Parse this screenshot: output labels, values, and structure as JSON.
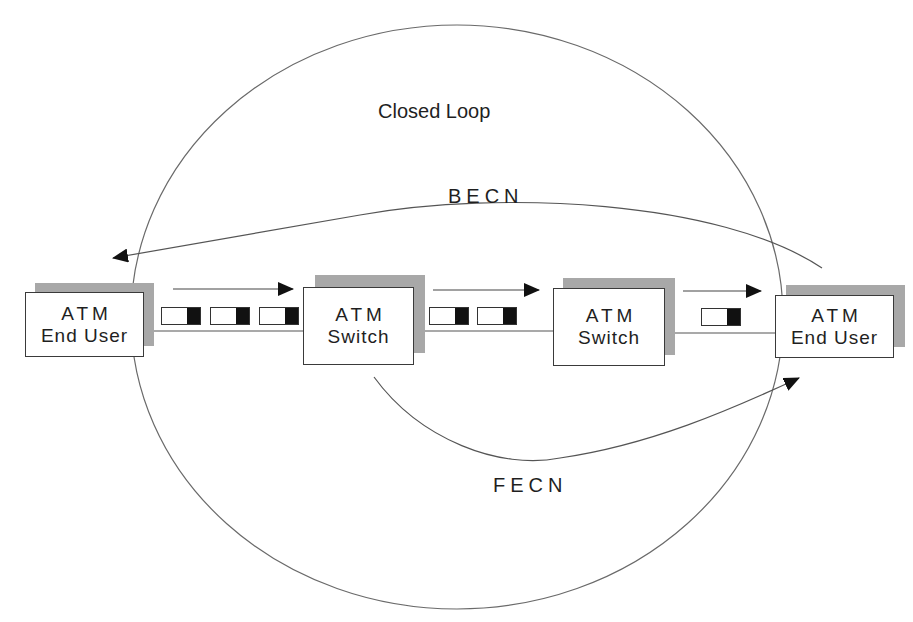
{
  "diagram": {
    "title": "Closed Loop",
    "colors": {
      "line": "#555555",
      "box_border": "#3a3a3a",
      "shadow": "#a8a8a8",
      "cell_header": "#111111",
      "background": "#ffffff"
    },
    "nodes": [
      {
        "id": "end-user-left",
        "line1": "ATM",
        "line2": "End User"
      },
      {
        "id": "switch-1",
        "line1": "ATM",
        "line2": "Switch"
      },
      {
        "id": "switch-2",
        "line1": "ATM",
        "line2": "Switch"
      },
      {
        "id": "end-user-right",
        "line1": "ATM",
        "line2": "End User"
      }
    ],
    "links": [
      {
        "from": "end-user-left",
        "to": "switch-1",
        "cells": 3
      },
      {
        "from": "switch-1",
        "to": "switch-2",
        "cells": 2
      },
      {
        "from": "switch-2",
        "to": "end-user-right",
        "cells": 1
      }
    ],
    "feedback": {
      "becn": {
        "label": "BECN",
        "from": "end-user-right",
        "to": "end-user-left",
        "direction": "backward"
      },
      "fecn": {
        "label": "FECN",
        "from": "switch-1",
        "to": "end-user-right",
        "direction": "forward"
      }
    }
  }
}
